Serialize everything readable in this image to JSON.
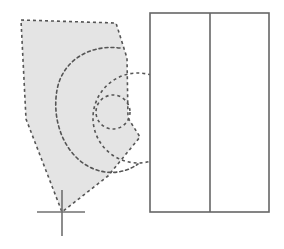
{
  "canvas": {
    "width": 284,
    "height": 249,
    "background_color": "#ffffff"
  },
  "style": {
    "fill_gray": "#e4e4e4",
    "dash_stroke_color": "#555555",
    "solid_stroke_color": "#666666",
    "crosshair_color": "#707070",
    "dash_pattern": "3,3",
    "dash_width": 1.6,
    "solid_width": 1.6,
    "crosshair_width": 1.6
  },
  "shapes": {
    "region_polygon": {
      "name": "shaded-region",
      "points": "21,20 116,23 127,58 128,118 140,137 108,176 62,212 26,119",
      "fill": "#e4e4e4",
      "stroke": "#555555",
      "dashed": true
    },
    "outer_circle": {
      "name": "outer-dashed-circle",
      "cx": 138,
      "cy": 118,
      "r": 45,
      "dashed": true
    },
    "middle_spiral": {
      "name": "middle-dashed-curve",
      "path": "M 120,48 C 88,44 62,62 57,90 C 52,118 62,150 86,165 C 104,176 124,174 138,164",
      "dashed": true
    },
    "inner_circle": {
      "name": "inner-dashed-circle",
      "cx": 113,
      "cy": 112,
      "r": 17,
      "dashed": true
    },
    "crosshair": {
      "name": "origin-crosshair",
      "cx": 62,
      "cy": 212,
      "left": 37,
      "right": 85,
      "top": 190,
      "bottom": 236
    },
    "rectangle": {
      "name": "panel-rectangle",
      "x": 150,
      "y": 13,
      "width": 119,
      "height": 199,
      "fill": "#ffffff",
      "stroke": "#666666"
    },
    "rectangle_divider": {
      "name": "panel-divider-line",
      "x": 210,
      "y1": 13,
      "y2": 212
    }
  }
}
